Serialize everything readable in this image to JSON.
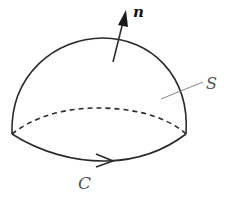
{
  "diagram": {
    "type": "surface-with-boundary",
    "labels": {
      "normal": "n",
      "surface": "S",
      "curve": "C"
    },
    "colors": {
      "stroke": "#2a2a2a",
      "leader": "#888888",
      "background": "#ffffff"
    }
  }
}
